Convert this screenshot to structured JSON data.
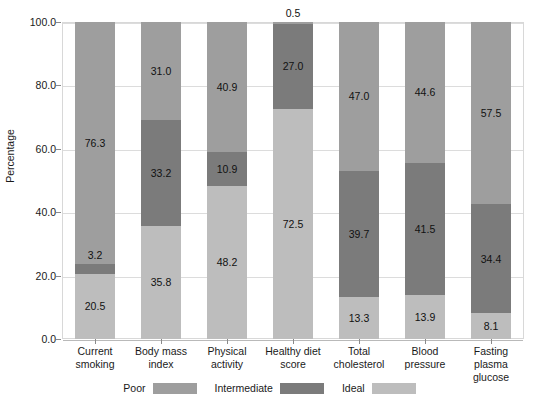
{
  "chart_data": {
    "type": "bar",
    "subtype": "stacked-bar-100",
    "title": "",
    "xlabel": "",
    "ylabel": "Percentage",
    "ylim": [
      0,
      100
    ],
    "ytick_labels": [
      "0.0",
      "20.0",
      "40.0",
      "60.0",
      "80.0",
      "100.0"
    ],
    "ytick_values": [
      0,
      20,
      40,
      60,
      80,
      100
    ],
    "grid": true,
    "legend_position": "bottom",
    "categories": [
      "Current smoking",
      "Body mass index",
      "Physical activity",
      "Healthy diet score",
      "Total cholesterol",
      "Blood pressure",
      "Fasting plasma glucose"
    ],
    "category_lines": [
      [
        "Current",
        "smoking"
      ],
      [
        "Body mass",
        "index"
      ],
      [
        "Physical",
        "activity"
      ],
      [
        "Healthy diet",
        "score"
      ],
      [
        "Total",
        "cholesterol"
      ],
      [
        "Blood",
        "pressure"
      ],
      [
        "Fasting plasma",
        "glucose"
      ]
    ],
    "series": [
      {
        "name": "Poor",
        "color": "#9e9e9e",
        "values": [
          76.3,
          31.0,
          40.9,
          0.5,
          47.0,
          44.6,
          57.5
        ],
        "labels": [
          "76.3",
          "31.0",
          "40.9",
          "0.5",
          "47.0",
          "44.6",
          "57.5"
        ]
      },
      {
        "name": "Intermediate",
        "color": "#7b7b7b",
        "values": [
          3.2,
          33.2,
          10.9,
          27.0,
          39.7,
          41.5,
          34.4
        ],
        "labels": [
          "3.2",
          "33.2",
          "10.9",
          "27.0",
          "39.7",
          "41.5",
          "34.4"
        ]
      },
      {
        "name": "Ideal",
        "color": "#bdbdbd",
        "values": [
          20.5,
          35.8,
          48.2,
          72.5,
          13.3,
          13.9,
          8.1
        ],
        "labels": [
          "20.5",
          "35.8",
          "48.2",
          "72.5",
          "13.3",
          "13.9",
          "8.1"
        ]
      }
    ]
  },
  "legend": {
    "entries": [
      {
        "label": "Poor",
        "color": "#9e9e9e"
      },
      {
        "label": "Intermediate",
        "color": "#7b7b7b"
      },
      {
        "label": "Ideal",
        "color": "#bdbdbd"
      }
    ]
  }
}
